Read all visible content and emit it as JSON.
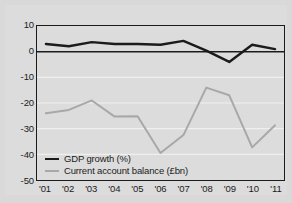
{
  "chart_data": {
    "type": "line",
    "title": "",
    "xlabel": "",
    "ylabel": "",
    "x": [
      "'01",
      "'02",
      "'03",
      "'04",
      "'05",
      "'06",
      "'07",
      "'08",
      "'09",
      "'10",
      "'11"
    ],
    "ylim": [
      -50,
      10
    ],
    "yticks": [
      10,
      0,
      -10,
      -20,
      -30,
      -40,
      -50
    ],
    "ytick_labels": [
      "10",
      "0",
      "-10",
      "-20",
      "-30",
      "-40",
      "-50"
    ],
    "grid": true,
    "legend_position": "bottom-left",
    "zero_line": true,
    "series": [
      {
        "name": "GDP growth (%)",
        "color": "#1b1b1b",
        "values": [
          3.0,
          2.1,
          3.7,
          3.0,
          3.0,
          2.7,
          4.2,
          0.4,
          -4.0,
          2.7,
          1.0
        ]
      },
      {
        "name": "Current account balance (£bn)",
        "color": "#a8a8a8",
        "values": [
          -24.0,
          -22.7,
          -19.0,
          -25.3,
          -25.2,
          -39.5,
          -32.5,
          -14.0,
          -17.0,
          -37.3,
          -28.7
        ]
      }
    ]
  },
  "legend": {
    "items": [
      {
        "label": "GDP growth (%)",
        "color": "#1b1b1b"
      },
      {
        "label": "Current account balance (£bn)",
        "color": "#a8a8a8"
      }
    ]
  },
  "colors": {
    "background": "#d9d9d9",
    "panel": "#dcdcdc",
    "axis": "#1b1b1b",
    "gridline": "#efefef",
    "gdp_line": "#1b1b1b",
    "current_account_line": "#a8a8a8"
  }
}
